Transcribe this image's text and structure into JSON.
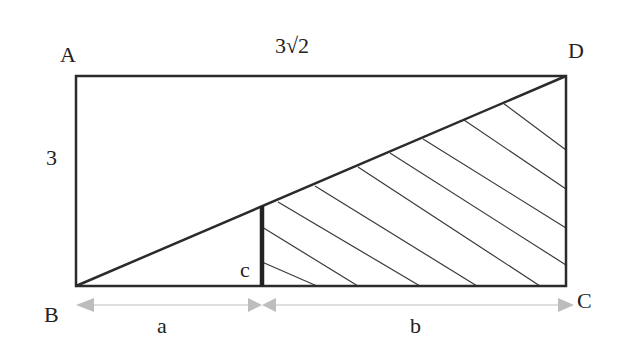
{
  "diagram": {
    "type": "geometry",
    "vertices": {
      "A": {
        "label": "A"
      },
      "B": {
        "label": "B"
      },
      "C": {
        "label": "C"
      },
      "D": {
        "label": "D"
      }
    },
    "measurements": {
      "top_side": "3√2",
      "left_side": "3",
      "segment_c": "c",
      "bottom_left_part": "a",
      "bottom_right_part": "b"
    },
    "colors": {
      "stroke": "#2b2b2b",
      "arrow": "#bdbdbd",
      "background": "#ffffff"
    }
  }
}
